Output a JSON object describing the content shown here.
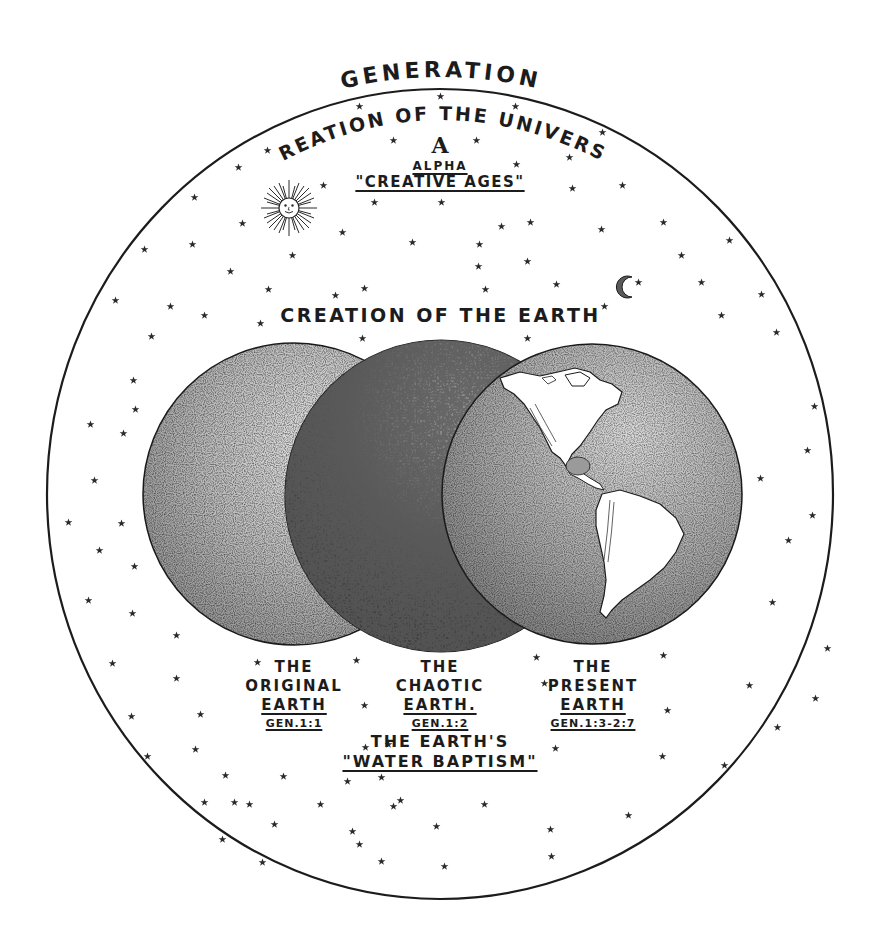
{
  "diagram": {
    "title": "GENERATION",
    "outer_arc_label": "CREATION OF THE UNIVERSE",
    "alpha": {
      "symbol": "A",
      "word": "ALPHA",
      "subtitle": "\"CREATIVE AGES\""
    },
    "section_title": "CREATION OF THE EARTH",
    "icons": [
      "sun-face-icon",
      "crescent-moon-icon",
      "star-icon"
    ],
    "spheres": [
      {
        "line1": "THE",
        "line2": "ORIGINAL",
        "line3": "EARTH",
        "ref": "GEN.1:1"
      },
      {
        "line1": "THE",
        "line2": "CHAOTIC",
        "line3": "EARTH.",
        "ref": "GEN.1:2"
      },
      {
        "line1": "THE",
        "line2": "PRESENT",
        "line3": "EARTH",
        "ref": "GEN.1:3-2:7"
      }
    ],
    "baptism": {
      "line1": "THE EARTH'S",
      "line2": "\"WATER BAPTISM\""
    },
    "colors": {
      "ink": "#1c1c1c",
      "paper": "#ffffff",
      "sphere_light": "#b9b9b9",
      "sphere_dark": "#4a4a4a"
    }
  }
}
